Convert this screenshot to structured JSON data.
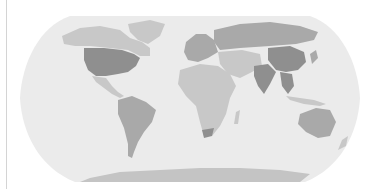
{
  "map": {
    "projection": "robinson",
    "colors": {
      "background": "#ffffff",
      "ocean": "#ebebeb",
      "land_default": "#c8c8c8",
      "land_highlight": "#8f8f8f",
      "land_medium": "#a9a9a9",
      "antarctica": "#c4c4c4",
      "edge_line": "#d4d4d4"
    },
    "regions": [
      {
        "name": "north-america",
        "shade": "default"
      },
      {
        "name": "united-states",
        "shade": "highlight"
      },
      {
        "name": "mexico-central-america",
        "shade": "default"
      },
      {
        "name": "greenland",
        "shade": "default"
      },
      {
        "name": "south-america",
        "shade": "medium"
      },
      {
        "name": "europe",
        "shade": "medium"
      },
      {
        "name": "russia",
        "shade": "medium"
      },
      {
        "name": "africa",
        "shade": "default"
      },
      {
        "name": "south-africa",
        "shade": "highlight"
      },
      {
        "name": "middle-east",
        "shade": "default"
      },
      {
        "name": "india",
        "shade": "highlight"
      },
      {
        "name": "china",
        "shade": "highlight"
      },
      {
        "name": "southeast-asia",
        "shade": "highlight"
      },
      {
        "name": "japan",
        "shade": "medium"
      },
      {
        "name": "indonesia",
        "shade": "default"
      },
      {
        "name": "australia",
        "shade": "medium"
      },
      {
        "name": "new-zealand",
        "shade": "default"
      },
      {
        "name": "madagascar",
        "shade": "default"
      },
      {
        "name": "antarctica",
        "shade": "default"
      }
    ]
  }
}
